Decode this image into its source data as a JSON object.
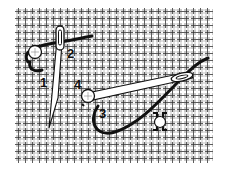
{
  "figure": {
    "step_labels": [
      {
        "id": "1",
        "text": "1",
        "x": 40,
        "y": 76
      },
      {
        "id": "2",
        "text": "2",
        "x": 67,
        "y": 47
      },
      {
        "id": "3",
        "text": "3",
        "x": 99,
        "y": 107
      },
      {
        "id": "4",
        "text": "4",
        "x": 74,
        "y": 78
      }
    ],
    "colors": {
      "canvas_thread": "#222222",
      "background": "#ffffff",
      "working_thread": "#111111",
      "needle_fill": "#ffffff",
      "bead_fill": "#ffffff"
    }
  }
}
